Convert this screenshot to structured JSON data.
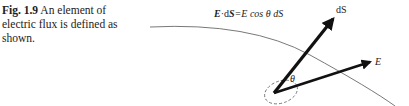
{
  "caption": {
    "figure_label": "Fig. 1.9",
    "text": " An element of electric flux is defined as shown."
  },
  "diagram": {
    "formula": {
      "E_bold": "E",
      "dot": "·d",
      "S_bold": "S",
      "rest": "=E cos θ dS"
    },
    "labels": {
      "dS": "dS",
      "E": "E",
      "theta": "θ"
    }
  }
}
